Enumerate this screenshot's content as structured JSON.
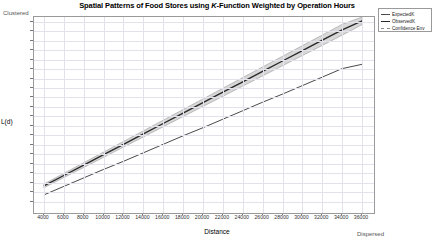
{
  "chart_data": {
    "type": "line",
    "title": "Spatial Patterns of Food Stores using K-Function Weighted by Operation Hours",
    "title_prefix": "Spatial Patterns of Food Stores using ",
    "title_italic": "K",
    "title_suffix": "-Function Weighted by Operation Hours",
    "xlabel": "Distance",
    "ylabel": "L(d)",
    "axis_top_note": "Clustered",
    "axis_bottom_note": "Dispersed",
    "grid": true,
    "legend_position": "top-right",
    "xlim": [
      3000,
      37000
    ],
    "ylim": [
      0,
      41000
    ],
    "xticks": [
      4000,
      6000,
      8000,
      10000,
      12000,
      14000,
      16000,
      18000,
      20000,
      22000,
      24000,
      26000,
      28000,
      30000,
      32000,
      34000,
      36000
    ],
    "yticks": [
      2000,
      4000,
      6000,
      8000,
      10000,
      12000,
      14000,
      16000,
      18000,
      20000,
      22000,
      24000,
      26000,
      28000,
      30000,
      32000,
      34000,
      36000,
      38000,
      40000
    ],
    "x": [
      4000,
      6000,
      8000,
      10000,
      12000,
      14000,
      16000,
      18000,
      20000,
      22000,
      24000,
      26000,
      28000,
      30000,
      32000,
      34000,
      36000
    ],
    "series": [
      {
        "name": "ExpectedK",
        "color": "#4a4a4a",
        "values": [
          3400,
          5200,
          7000,
          8800,
          10500,
          12300,
          14100,
          15900,
          17600,
          19400,
          21200,
          23000,
          24700,
          26500,
          28300,
          30100,
          31000
        ]
      },
      {
        "name": "ObservedK",
        "color": "#2a2a2a",
        "values": [
          5300,
          7500,
          9700,
          11900,
          14100,
          16300,
          18500,
          20700,
          22900,
          25100,
          27300,
          29500,
          31700,
          33900,
          36100,
          38300,
          40200
        ]
      },
      {
        "name": "Confidence Env",
        "color": "#8a8a8a",
        "upper": [
          5700,
          7950,
          10200,
          12450,
          14700,
          16950,
          19200,
          21450,
          23700,
          25950,
          28200,
          30450,
          32700,
          34950,
          37200,
          39450,
          41000
        ],
        "lower": [
          4900,
          7050,
          9200,
          11350,
          13500,
          15650,
          17800,
          19950,
          22100,
          24250,
          26400,
          28550,
          30700,
          32850,
          35000,
          37150,
          39400
        ]
      }
    ],
    "legend": [
      "ExpectedK",
      "ObservedK",
      "Confidence Env"
    ]
  }
}
